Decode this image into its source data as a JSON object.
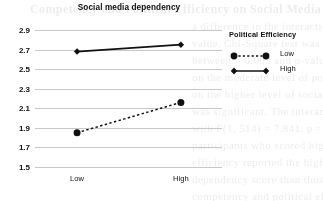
{
  "chart_data": {
    "type": "line",
    "title": "Social media dependency",
    "xlabel": "",
    "ylabel": "",
    "categories": [
      "Low",
      "High"
    ],
    "series": [
      {
        "name": "Low",
        "values": [
          1.85,
          2.16
        ],
        "style": "dotted",
        "marker": "circle"
      },
      {
        "name": "High",
        "values": [
          2.68,
          2.75
        ],
        "style": "solid",
        "marker": "diamond"
      }
    ],
    "ylim": [
      1.5,
      2.9
    ],
    "ytick_step": 0.2,
    "yticks": [
      "1.5",
      "1.7",
      "1.9",
      "2.1",
      "2.3",
      "2.5",
      "2.7",
      "2.9"
    ],
    "grid": true,
    "legend_position": "right",
    "legend_title": "Political Efficiency",
    "line_color": "#111111",
    "grid_color": "#c8c8c8"
  },
  "legend": {
    "title": "Political Efficiency",
    "entries": [
      {
        "label": "Low"
      },
      {
        "label": "High"
      }
    ]
  },
  "background_text": [
    {
      "text": "Competency and Political Efficiency on Social Media",
      "x": 30,
      "y": 2,
      "size": 12,
      "weight": "bold"
    },
    {
      "text": "a difference in the interaction effect across the",
      "x": 192,
      "y": 20,
      "size": 11
    },
    {
      "text": "value. Chi-Square test was also significant",
      "x": 192,
      "y": 37,
      "size": 11
    },
    {
      "text": "between = 0.003 and p-value = 0.001, which",
      "x": 192,
      "y": 54,
      "size": 11
    },
    {
      "text": "on the moderate level of political competency",
      "x": 192,
      "y": 71,
      "size": 11
    },
    {
      "text": "on the higher level of social media dependency",
      "x": 192,
      "y": 88,
      "size": 11
    },
    {
      "text": "was significant. The interaction was confirmed",
      "x": 192,
      "y": 105,
      "size": 11
    },
    {
      "text": "with F(1, 514) = 7.841, p = 0.005 (Figure 2).",
      "x": 192,
      "y": 122,
      "size": 11
    },
    {
      "text": "participants who scored higher in political",
      "x": 192,
      "y": 139,
      "size": 11
    },
    {
      "text": "efficiency reported the higher social media",
      "x": 192,
      "y": 156,
      "size": 11
    },
    {
      "text": "dependency score than those scoring",
      "x": 192,
      "y": 173,
      "size": 11
    },
    {
      "text": "competency and political efficiency on the",
      "x": 192,
      "y": 190,
      "size": 11
    }
  ]
}
